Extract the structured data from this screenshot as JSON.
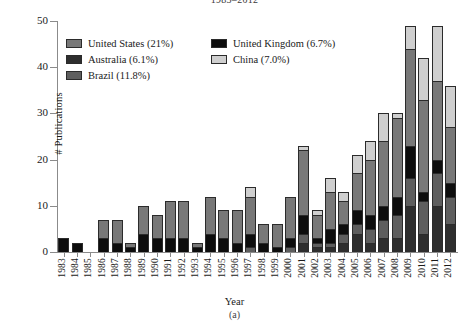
{
  "figure": {
    "title_clipped": "1983–2012",
    "caption": "(a)"
  },
  "chart_data": {
    "type": "bar",
    "stacked": true,
    "title": "1983–2012",
    "xlabel": "Year",
    "ylabel": "# Publications",
    "ylim": [
      0,
      50
    ],
    "yticks": [
      0,
      10,
      20,
      30,
      40,
      50
    ],
    "grid": false,
    "legend_position": "upper-left-inside",
    "categories": [
      "1983",
      "1984",
      "1985",
      "1986",
      "1987",
      "1988",
      "1989",
      "1990",
      "1991",
      "1992",
      "1993",
      "1994",
      "1995",
      "1996",
      "1997",
      "1998",
      "1999",
      "2000",
      "2001",
      "2002",
      "2003",
      "2004",
      "2005",
      "2006",
      "2007",
      "2008",
      "2009",
      "2010",
      "2011",
      "2012"
    ],
    "series": [
      {
        "name": "United Kingdom (6.7%)",
        "label": "United Kingdom",
        "percent": "6.7%",
        "color": "#0d0d0d",
        "values": [
          3,
          2,
          0,
          3,
          2,
          1,
          4,
          3,
          3,
          3,
          1,
          4,
          3,
          2,
          3,
          2,
          1,
          2,
          4,
          1,
          3,
          2,
          3,
          3,
          3,
          4,
          7,
          2,
          3,
          3
        ]
      },
      {
        "name": "Australia (6.1%)",
        "label": "Australia",
        "percent": "6.1%",
        "color": "#2e2e2e",
        "values": [
          0,
          0,
          0,
          0,
          0,
          0,
          0,
          0,
          0,
          0,
          0,
          0,
          0,
          0,
          0,
          0,
          0,
          0,
          2,
          1,
          1,
          2,
          4,
          2,
          3,
          3,
          10,
          4,
          10,
          6
        ]
      },
      {
        "name": "Brazil (11.8%)",
        "label": "Brazil",
        "percent": "11.8%",
        "color": "#5e5e5e",
        "values": [
          0,
          0,
          0,
          0,
          0,
          0,
          0,
          0,
          0,
          0,
          0,
          0,
          0,
          0,
          1,
          0,
          0,
          1,
          2,
          1,
          1,
          2,
          2,
          3,
          4,
          5,
          6,
          7,
          7,
          6
        ]
      },
      {
        "name": "United States (21%)",
        "label": "United States",
        "percent": "21%",
        "color": "#787878",
        "values": [
          0,
          0,
          0,
          4,
          5,
          1,
          6,
          5,
          8,
          8,
          1,
          8,
          6,
          7,
          8,
          4,
          5,
          9,
          14,
          5,
          8,
          5,
          8,
          12,
          14,
          17,
          21,
          20,
          17,
          12
        ]
      },
      {
        "name": "China (7.0%)",
        "label": "China",
        "percent": "7.0%",
        "color": "#cfcfcf",
        "values": [
          0,
          0,
          0,
          0,
          0,
          0,
          0,
          0,
          0,
          0,
          0,
          0,
          0,
          0,
          2,
          0,
          0,
          0,
          1,
          1,
          3,
          2,
          4,
          4,
          6,
          1,
          5,
          9,
          12,
          9
        ]
      }
    ]
  },
  "legend": {
    "rows": [
      [
        {
          "label": "United States (21%)",
          "color": "#787878",
          "name": "legend-united-states"
        },
        {
          "label": "United Kingdom (6.7%)",
          "color": "#0d0d0d",
          "name": "legend-united-kingdom"
        }
      ],
      [
        {
          "label": "Australia (6.1%)",
          "color": "#2e2e2e",
          "name": "legend-australia"
        },
        {
          "label": "China (7.0%)",
          "color": "#cfcfcf",
          "name": "legend-china"
        }
      ],
      [
        {
          "label": "Brazil (11.8%)",
          "color": "#5e5e5e",
          "name": "legend-brazil"
        }
      ]
    ]
  }
}
